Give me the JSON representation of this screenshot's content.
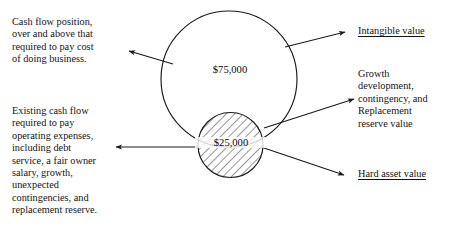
{
  "figure": {
    "type": "venn-style business value diagram",
    "background_color": "#ffffff",
    "stroke_color": "#1a1a1a"
  },
  "left_labels": {
    "top": "Cash flow position,\nover and above that\nrequired to pay cost\nof doing business.",
    "bottom": "Existing cash flow\nrequired to pay\noperating expenses,\nincluding debt\nservice, a fair owner\nsalary, growth,\nunexpected\ncontingencies, and\nreplacement reserve."
  },
  "right_labels": {
    "top_heading": "Intangible value",
    "middle": "Growth\ndevelopment,\ncontingency, and\nReplacement\nreserve value",
    "bottom_heading": "Hard asset value"
  },
  "circles": {
    "large": {
      "amount": "$75,000",
      "fill": "none",
      "stroke": "#1a1a1a"
    },
    "small": {
      "amount": "$25,000",
      "fill": "diagonal-hatch",
      "stroke": "#1a1a1a"
    }
  },
  "arrows": [
    {
      "name": "arrow-to-intangible-value",
      "direction": "right"
    },
    {
      "name": "arrow-to-growth-reserve-value",
      "direction": "right"
    },
    {
      "name": "arrow-to-hard-asset-value",
      "direction": "right"
    },
    {
      "name": "arrow-to-cash-flow-position",
      "direction": "left"
    },
    {
      "name": "arrow-to-existing-cash-flow",
      "direction": "left"
    }
  ]
}
